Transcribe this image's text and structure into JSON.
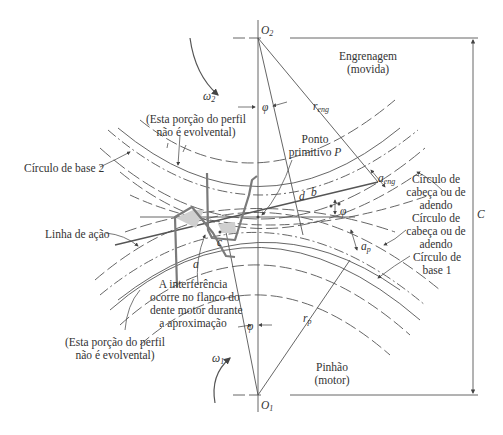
{
  "figure": {
    "centers": {
      "driven": "O2",
      "driver": "O1"
    },
    "center_distance_label": "C",
    "angle_symbol": "φ",
    "angular_velocity": {
      "gear": "ω2",
      "pinion": "ω1"
    },
    "radii": {
      "gear": "r_eng",
      "pinion": "r_p"
    },
    "addenda": {
      "gear": "a_eng",
      "pinion": "a_p"
    },
    "points": [
      "a",
      "b",
      "c",
      "d",
      "P"
    ]
  },
  "labels": {
    "o2": "O",
    "o2_sub": "2",
    "o1": "O",
    "o1_sub": "1",
    "gear_line1": "Engrenagem",
    "gear_line2": "(movida)",
    "pinion_line1": "Pinhão",
    "pinion_line2": "(motor)",
    "omega2": "ω",
    "omega2_sub": "2",
    "omega1": "ω",
    "omega1_sub": "1",
    "r_eng": "r",
    "r_eng_sub": "eng",
    "r_p": "r",
    "r_p_sub": "p",
    "a_eng": "a",
    "a_eng_sub": "eng",
    "a_p": "a",
    "a_p_sub": "p",
    "phi_top": "φ",
    "phi_right": "φ",
    "phi_bottom": "φ",
    "C": "C",
    "pitch_point_line1": "Ponto",
    "pitch_point_line2": "primitivo",
    "pitch_point_P": "P",
    "not_involute_top_line1": "(Esta porção do perfil",
    "not_involute_top_line2": "não é evolvental)",
    "not_involute_bottom_line1": "(Esta porção do perfil",
    "not_involute_bottom_line2": "não é evolvental)",
    "base_circle_2": "Círculo de base 2",
    "line_of_action": "Linha de ação",
    "interference_line1": "A interferência",
    "interference_line2": "ocorre no flanco do",
    "interference_line3": "dente motor durante",
    "interference_line4": "a aproximação",
    "addendum_gear_line1": "Círculo de",
    "addendum_gear_line2": "cabeça ou de",
    "addendum_gear_line3": "adendo",
    "addendum_pinion_line1": "Círculo de",
    "addendum_pinion_line2": "cabeça ou de",
    "addendum_pinion_line3": "adendo",
    "base_circle_1_line1": "Círculo de",
    "base_circle_1_line2": "base 1",
    "point_a": "a",
    "point_b": "b",
    "point_c": "c",
    "point_d": "d"
  },
  "colors": {
    "line": "#555555",
    "tooth": "#7a7a7a",
    "interference_fill": "#cfcfcf",
    "text": "#333333"
  }
}
